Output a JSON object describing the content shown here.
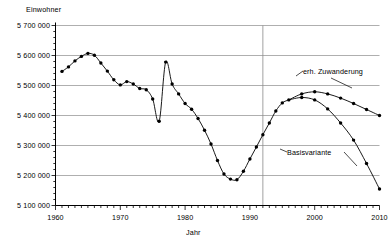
{
  "chart_data": {
    "type": "line",
    "title": "",
    "xlabel": "Jahr",
    "ylabel": "Einwohner",
    "xlim": [
      1960,
      2010
    ],
    "ylim": [
      5100000,
      5700000
    ],
    "grid": true,
    "legend_position": "inline-annotation",
    "y_tick_labels": [
      "5 700 000",
      "5 600 000",
      "5 500 000",
      "5 400 000",
      "5 300 000",
      "5 200 000",
      "5 100 000"
    ],
    "y_tick_values": [
      5700000,
      5600000,
      5500000,
      5400000,
      5300000,
      5200000,
      5100000
    ],
    "x_tick_labels": [
      "1960",
      "1970",
      "1980",
      "1990",
      "2000",
      "2010"
    ],
    "x_tick_values": [
      1960,
      1970,
      1980,
      1990,
      2000,
      2010
    ],
    "x_minor_tick_step": 1,
    "annotations": [
      {
        "text": "erh. Zuwanderung",
        "x": 2001,
        "y": 5452000
      },
      {
        "text": "Basisvariante",
        "x": 1999,
        "y": 5273000
      }
    ],
    "divider_line_x": 1992,
    "series": [
      {
        "name": "historisch",
        "x": [
          1961,
          1962,
          1963,
          1964,
          1965,
          1966,
          1967,
          1968,
          1969,
          1970,
          1971,
          1972,
          1973,
          1974,
          1975,
          1976,
          1977,
          1978,
          1979,
          1980,
          1981,
          1982,
          1983,
          1984,
          1985,
          1986,
          1987,
          1988,
          1989,
          1990,
          1991,
          1992,
          1993,
          1994,
          1995,
          1996
        ],
        "values": [
          5547000,
          5562000,
          5582000,
          5597000,
          5607000,
          5601000,
          5575000,
          5548000,
          5519000,
          5502000,
          5513000,
          5505000,
          5490000,
          5486000,
          5455000,
          5381000,
          5578000,
          5505000,
          5472000,
          5440000,
          5421000,
          5390000,
          5351000,
          5305000,
          5250000,
          5205000,
          5188000,
          5186000,
          5214000,
          5255000,
          5295000,
          5336000,
          5375000,
          5415000,
          5442000,
          5452000
        ]
      },
      {
        "name": "erh. Zuwanderung",
        "x": [
          1996,
          1998,
          2000,
          2002,
          2004,
          2006,
          2008,
          2010
        ],
        "values": [
          5452000,
          5472000,
          5479000,
          5472000,
          5458000,
          5440000,
          5420000,
          5400000
        ]
      },
      {
        "name": "Basisvariante",
        "x": [
          1996,
          1998,
          2000,
          2002,
          2004,
          2006,
          2008,
          2010
        ],
        "values": [
          5452000,
          5460000,
          5452000,
          5422000,
          5375000,
          5318000,
          5240000,
          5155000
        ]
      }
    ]
  }
}
